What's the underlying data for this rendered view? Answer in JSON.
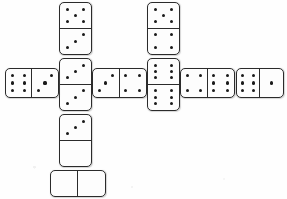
{
  "scene": {
    "title": "Domino Cross Layout",
    "description": "A set of dominoes arranged in a cross / plus shape on white paper",
    "background_color": "#ffffff",
    "tile_face_color": "#fdfdfd",
    "tile_border_color": "#2b2b2b",
    "pip_color": "#1a1a1a",
    "tile_count": 9,
    "canvas": {
      "width": 287,
      "height": 199
    }
  },
  "dominoes": [
    {
      "id": "domino-col1-top",
      "name": "vertical-5-3",
      "orientation": "vertical",
      "values": [
        5,
        3
      ],
      "label": "5|3",
      "x": 59,
      "y": 2,
      "w": 33,
      "h": 53
    },
    {
      "id": "domino-col1-middle",
      "name": "vertical-3-3",
      "orientation": "vertical",
      "values": [
        3,
        3
      ],
      "label": "3|3",
      "x": 59,
      "y": 58,
      "w": 33,
      "h": 53
    },
    {
      "id": "domino-col1-bottom",
      "name": "vertical-3-0",
      "orientation": "vertical",
      "values": [
        3,
        0
      ],
      "label": "3|0",
      "x": 59,
      "y": 114,
      "w": 33,
      "h": 53
    },
    {
      "id": "domino-bottom-blank",
      "name": "horizontal-0-0",
      "orientation": "horizontal",
      "values": [
        0,
        0
      ],
      "label": "0|0",
      "x": 50,
      "y": 170,
      "w": 56,
      "h": 27
    },
    {
      "id": "domino-row-far-left",
      "name": "horizontal-6-3",
      "orientation": "horizontal",
      "values": [
        6,
        3
      ],
      "label": "6|3",
      "x": 5,
      "y": 68,
      "w": 54,
      "h": 30
    },
    {
      "id": "domino-row-left-center",
      "name": "horizontal-3-4",
      "orientation": "horizontal",
      "values": [
        3,
        4
      ],
      "label": "3|4",
      "x": 92,
      "y": 68,
      "w": 55,
      "h": 30
    },
    {
      "id": "domino-col2-top",
      "name": "vertical-5-4",
      "orientation": "vertical",
      "values": [
        5,
        4
      ],
      "label": "5|4",
      "x": 147,
      "y": 2,
      "w": 33,
      "h": 53
    },
    {
      "id": "domino-col2-bottom",
      "name": "vertical-6-6",
      "orientation": "vertical",
      "values": [
        6,
        6
      ],
      "label": "6|6",
      "x": 147,
      "y": 58,
      "w": 33,
      "h": 53
    },
    {
      "id": "domino-row-right-center",
      "name": "horizontal-4-6",
      "orientation": "horizontal",
      "values": [
        4,
        6
      ],
      "label": "4|6",
      "x": 180,
      "y": 68,
      "w": 55,
      "h": 30
    },
    {
      "id": "domino-row-far-right",
      "name": "horizontal-6-1",
      "orientation": "horizontal",
      "values": [
        6,
        1
      ],
      "label": "6|1",
      "x": 236,
      "y": 68,
      "w": 48,
      "h": 30
    }
  ],
  "pip_patterns": {
    "0": [],
    "1": [
      "p-mc"
    ],
    "2": [
      "p-tl",
      "p-br"
    ],
    "3": [
      "p-tr",
      "p-mc",
      "p-bl"
    ],
    "4": [
      "p-tl",
      "p-tr",
      "p-bl",
      "p-br"
    ],
    "5": [
      "p-tl",
      "p-tr",
      "p-mc",
      "p-bl",
      "p-br"
    ],
    "6": [
      "p-tl",
      "p-tr",
      "p-ml",
      "p-mr",
      "p-bl",
      "p-br"
    ]
  }
}
